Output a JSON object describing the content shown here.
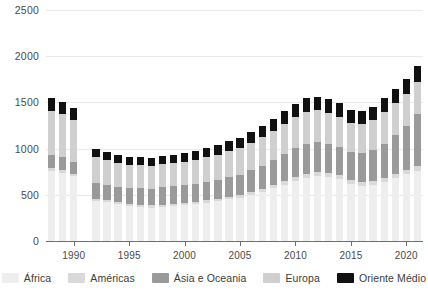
{
  "chart_data": {
    "type": "bar",
    "stacked": true,
    "title": "",
    "subtitle": "",
    "xlabel": "",
    "ylabel": "",
    "ylim": [
      0,
      2500
    ],
    "ytick_values": [
      0,
      500,
      1000,
      1500,
      2000,
      2500
    ],
    "ytick_labels": [
      "0",
      "500",
      "1000",
      "1500",
      "2000",
      "2500"
    ],
    "xtick_labels": [
      "1990",
      "1995",
      "2000",
      "2005",
      "2010",
      "2015",
      "2020"
    ],
    "xtick_years": [
      1990,
      1995,
      2000,
      2005,
      2010,
      2015,
      2020
    ],
    "grid": "horizontal",
    "legend_position": "bottom",
    "categories": [
      1988,
      1989,
      1990,
      1991,
      1992,
      1993,
      1994,
      1995,
      1996,
      1997,
      1998,
      1999,
      2000,
      2001,
      2002,
      2003,
      2004,
      2005,
      2006,
      2007,
      2008,
      2009,
      2010,
      2011,
      2012,
      2013,
      2014,
      2015,
      2016,
      2017,
      2018,
      2019,
      2020,
      2021
    ],
    "series": [
      {
        "name": "África",
        "color": "#eeeeee",
        "values": [
          760,
          740,
          700,
          null,
          430,
          420,
          400,
          380,
          370,
          360,
          370,
          380,
          390,
          400,
          410,
          430,
          450,
          470,
          500,
          530,
          570,
          610,
          650,
          680,
          700,
          690,
          670,
          620,
          600,
          610,
          640,
          680,
          720,
          760
        ]
      },
      {
        "name": "Américas",
        "color": "#d9d9d9",
        "values": [
          30,
          30,
          30,
          null,
          25,
          25,
          25,
          25,
          25,
          25,
          25,
          25,
          25,
          25,
          30,
          30,
          30,
          30,
          35,
          35,
          40,
          40,
          45,
          45,
          45,
          45,
          45,
          40,
          40,
          40,
          45,
          45,
          50,
          50
        ]
      },
      {
        "name": "Ásia e Oceania",
        "color": "#9a9a9a",
        "values": [
          140,
          140,
          130,
          null,
          170,
          165,
          160,
          170,
          175,
          180,
          185,
          190,
          190,
          195,
          200,
          205,
          210,
          215,
          230,
          250,
          265,
          290,
          310,
          330,
          330,
          320,
          300,
          300,
          310,
          330,
          370,
          420,
          470,
          560
        ]
      },
      {
        "name": "Europa",
        "color": "#cfcfcf",
        "values": [
          480,
          460,
          450,
          null,
          280,
          270,
          260,
          250,
          250,
          250,
          250,
          250,
          255,
          260,
          265,
          270,
          280,
          290,
          300,
          310,
          320,
          330,
          340,
          345,
          340,
          335,
          330,
          320,
          320,
          330,
          340,
          345,
          350,
          355
        ]
      },
      {
        "name": "Oriente Médio",
        "color": "#111111",
        "values": [
          135,
          130,
          130,
          null,
          90,
          85,
          85,
          85,
          85,
          85,
          85,
          90,
          90,
          95,
          100,
          105,
          110,
          115,
          120,
          125,
          130,
          135,
          140,
          145,
          145,
          145,
          145,
          140,
          140,
          145,
          150,
          155,
          160,
          165
        ]
      }
    ]
  },
  "legend": {
    "items": [
      {
        "label": "África",
        "color": "#eeeeee"
      },
      {
        "label": "Américas",
        "color": "#d9d9d9"
      },
      {
        "label": "Ásia e Oceania",
        "color": "#9a9a9a"
      },
      {
        "label": "Europa",
        "color": "#cfcfcf"
      },
      {
        "label": "Oriente Médio",
        "color": "#111111"
      }
    ]
  }
}
